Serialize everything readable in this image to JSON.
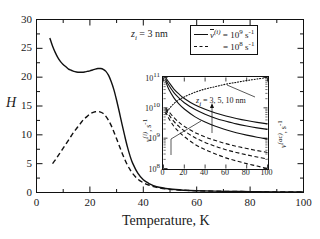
{
  "figure": {
    "annotation_zi": "z",
    "annotation_zi_sub": "i",
    "annotation_zi_rest": " = 3 nm"
  },
  "legend": {
    "entry1_symbol": "v",
    "entry1_sup": "(i)",
    "entry1_eq": " = 10",
    "entry1_exp": "9",
    "entry1_unit": " s",
    "entry1_unit_exp": "-1",
    "entry2_eq": " = 10",
    "entry2_exp": "8",
    "entry2_unit": " s",
    "entry2_unit_exp": "-1"
  },
  "main_axes": {
    "ylabel": "H",
    "xlabel": "Temperature, K",
    "ytick_labels": [
      "0",
      "5",
      "10",
      "15",
      "20",
      "25",
      "30"
    ],
    "xtick_labels": [
      "0",
      "20",
      "40",
      "60",
      "80",
      "100"
    ]
  },
  "inset_axes": {
    "ylabel_symbol": "v",
    "ylabel_sup": "(i)",
    "ylabel_rest": ", s",
    "ylabel_unit_exp": "-1",
    "ylabel_right_symbol": "v",
    "ylabel_right_sup": "(ac)",
    "ylabel_right_rest": ", s",
    "ylabel_right_unit_exp": "-1",
    "ytick_labels": [
      "10",
      "10",
      "10",
      "10"
    ],
    "ytick_exponents": [
      "8",
      "9",
      "10",
      "11"
    ],
    "xtick_labels": [
      "0",
      "20",
      "40",
      "60",
      "80",
      "100"
    ],
    "annotation": "z",
    "annotation_sub": "i",
    "annotation_rest": " = 3, 5, 10 nm"
  },
  "chart_data": {
    "type": "line",
    "title": "",
    "xlabel": "Temperature, K",
    "ylabel": "H",
    "xlim": [
      0,
      100
    ],
    "ylim": [
      0,
      30
    ],
    "grid": false,
    "legend_position": "top-right",
    "series": [
      {
        "name": "v_bar^(i) = 10^9 s^-1",
        "style": "solid",
        "x": [
          5,
          6,
          7,
          8,
          9,
          10,
          11,
          12,
          13,
          14,
          15,
          16,
          17,
          18,
          19,
          20,
          21,
          22,
          23,
          24,
          25,
          26,
          27,
          28,
          29,
          30,
          31,
          32,
          33,
          34,
          35,
          36,
          38,
          40,
          42,
          45,
          50,
          55,
          60,
          70,
          80,
          90,
          100
        ],
        "y": [
          26.8,
          25.4,
          24.3,
          23.4,
          22.7,
          22.2,
          21.8,
          21.4,
          21.2,
          21.0,
          20.9,
          20.85,
          20.85,
          20.9,
          21.0,
          21.1,
          21.25,
          21.4,
          21.5,
          21.5,
          21.35,
          21.0,
          20.3,
          19.2,
          17.8,
          16.0,
          14.0,
          11.9,
          9.9,
          8.0,
          6.4,
          5.1,
          3.3,
          2.2,
          1.6,
          1.0,
          0.6,
          0.4,
          0.3,
          0.2,
          0.15,
          0.1,
          0.1
        ]
      },
      {
        "name": "v_bar^(i) = 10^8 s^-1",
        "style": "dashed",
        "x": [
          6,
          7,
          8,
          9,
          10,
          11,
          12,
          13,
          14,
          15,
          16,
          17,
          18,
          19,
          20,
          21,
          22,
          23,
          24,
          25,
          26,
          27,
          28,
          29,
          30,
          31,
          32,
          33,
          34,
          35,
          36,
          38,
          40,
          42,
          45,
          50,
          55,
          60,
          70,
          80,
          90,
          100
        ],
        "y": [
          5.0,
          5.6,
          6.3,
          7.0,
          7.7,
          8.4,
          9.1,
          9.8,
          10.5,
          11.1,
          11.7,
          12.3,
          12.8,
          13.2,
          13.6,
          13.85,
          14.0,
          14.05,
          13.95,
          13.7,
          13.2,
          12.5,
          11.6,
          10.5,
          9.3,
          8.1,
          6.9,
          5.8,
          4.8,
          4.0,
          3.3,
          2.3,
          1.7,
          1.3,
          0.9,
          0.55,
          0.4,
          0.3,
          0.2,
          0.15,
          0.1,
          0.1
        ]
      }
    ]
  },
  "inset_chart_data": {
    "type": "line",
    "xlabel": "",
    "ylabel": "nu^(i), s^-1",
    "ylabel_right": "nu^(ac), s^-1",
    "xlim": [
      0,
      100
    ],
    "ylim_log": [
      8,
      11
    ],
    "grid": false,
    "series": [
      {
        "name": "z_i = 3 nm (solid)",
        "style": "solid",
        "x": [
          2,
          5,
          10,
          15,
          20,
          30,
          40,
          50,
          60,
          70,
          80,
          90,
          100
        ],
        "log_y": [
          11.0,
          10.85,
          10.62,
          10.45,
          10.31,
          10.1,
          9.95,
          9.83,
          9.73,
          9.65,
          9.58,
          9.52,
          9.47
        ]
      },
      {
        "name": "z_i = 5 nm (solid)",
        "style": "solid",
        "x": [
          2,
          5,
          10,
          15,
          20,
          30,
          40,
          50,
          60,
          70,
          80,
          90,
          100
        ],
        "log_y": [
          10.95,
          10.75,
          10.5,
          10.32,
          10.17,
          9.95,
          9.79,
          9.66,
          9.56,
          9.47,
          9.4,
          9.34,
          9.29
        ]
      },
      {
        "name": "z_i = 10 nm (solid)",
        "style": "solid",
        "x": [
          2,
          5,
          10,
          15,
          20,
          30,
          40,
          50,
          60,
          70,
          80,
          90,
          100
        ],
        "log_y": [
          10.88,
          10.62,
          10.33,
          10.12,
          9.96,
          9.71,
          9.53,
          9.39,
          9.28,
          9.18,
          9.1,
          9.03,
          8.97
        ]
      },
      {
        "name": "z_i = 3 nm (dashed)",
        "style": "dashed",
        "x": [
          2,
          5,
          10,
          15,
          20,
          30,
          40,
          50,
          60,
          70,
          80,
          90,
          100
        ],
        "log_y": [
          10.0,
          9.88,
          9.68,
          9.52,
          9.39,
          9.19,
          9.04,
          8.92,
          8.82,
          8.73,
          8.66,
          8.59,
          8.53
        ]
      },
      {
        "name": "z_i = 5 nm (dashed)",
        "style": "dashed",
        "x": [
          2,
          5,
          10,
          15,
          20,
          30,
          40,
          50,
          60,
          70,
          80,
          90,
          100
        ],
        "log_y": [
          9.95,
          9.78,
          9.55,
          9.38,
          9.24,
          9.02,
          8.86,
          8.73,
          8.62,
          8.53,
          8.45,
          8.38,
          8.31
        ]
      },
      {
        "name": "z_i = 10 nm (dashed)",
        "style": "dashed",
        "x": [
          2,
          5,
          10,
          15,
          20,
          30,
          40,
          50,
          60,
          70,
          80,
          90,
          100
        ],
        "log_y": [
          9.88,
          9.66,
          9.39,
          9.2,
          9.05,
          8.8,
          8.62,
          8.48,
          8.35,
          8.25,
          8.16,
          8.08,
          8.0
        ]
      },
      {
        "name": "nu^(ac) (dotted)",
        "style": "dotted",
        "x": [
          2,
          5,
          10,
          15,
          20,
          30,
          40,
          50,
          60,
          70,
          80,
          90,
          100
        ],
        "log_y": [
          9.8,
          9.95,
          10.14,
          10.27,
          10.36,
          10.51,
          10.62,
          10.7,
          10.78,
          10.84,
          10.9,
          10.95,
          11.0
        ]
      }
    ]
  }
}
